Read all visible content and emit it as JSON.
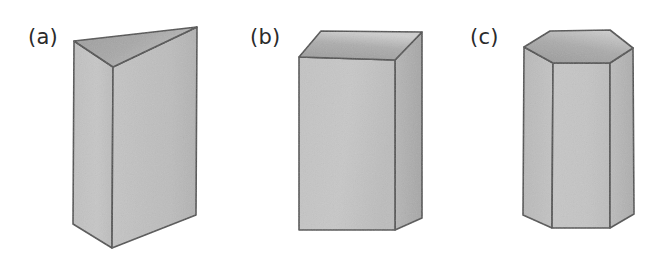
{
  "figure": {
    "background_color": "#ffffff",
    "width": 664,
    "height": 267,
    "panels": [
      {
        "id": "a",
        "label": "(a)",
        "shape_name": "triangular-prism",
        "description": "Triangular prism shown in oblique view with shaded top triangular face and two visible rectangular lateral faces",
        "base_sides": 3,
        "visible_lateral_faces": 2,
        "label_position": {
          "x": 28,
          "y": 27
        }
      },
      {
        "id": "b",
        "label": "(b)",
        "shape_name": "rectangular-prism",
        "description": "Rectangular prism (cuboid) shown in oblique view with shaded top face, a front face and a right side face",
        "base_sides": 4,
        "visible_lateral_faces": 2,
        "label_position": {
          "x": 250,
          "y": 27
        }
      },
      {
        "id": "c",
        "label": "(c)",
        "shape_name": "hexagonal-prism",
        "description": "Hexagonal prism shown in oblique view with shaded top hexagonal face and three visible rectangular lateral faces",
        "base_sides": 6,
        "visible_lateral_faces": 3,
        "label_position": {
          "x": 470,
          "y": 27
        }
      }
    ],
    "colors": {
      "outline": "#4a4a4a",
      "face_light": "#c6c6c6",
      "face_mid": "#bdbdbd",
      "face_dark": "#ababab",
      "top_face_dark": "#a3a3a3",
      "top_face_light": "#d2d2d2",
      "label_text": "#2b2b2b",
      "background": "#ffffff"
    }
  }
}
